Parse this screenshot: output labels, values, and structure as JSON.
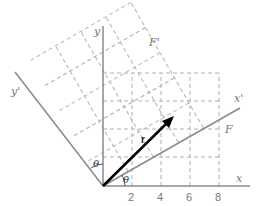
{
  "figure": {
    "type": "coordinate-rotation-diagram",
    "axes": {
      "x_label": "x",
      "y_label": "y",
      "x_prime_label": "x'",
      "y_prime_label": "y'"
    },
    "x_ticks": [
      "2",
      "4",
      "6",
      "8"
    ],
    "frames": {
      "unprimed_label": "F",
      "primed_label": "F'"
    },
    "vector_label": "r",
    "angle_label": "θ",
    "angle_label_2": "θ",
    "colors": {
      "axis": "#8a8a8a",
      "grid": "#b0b0b0",
      "vector": "#000000",
      "text": "#777777"
    }
  }
}
